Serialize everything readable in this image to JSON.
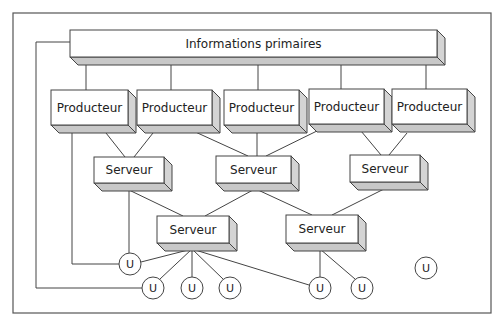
{
  "diagram": {
    "type": "network-topology",
    "frame": {
      "x1": 13,
      "y1": 13,
      "x2": 491,
      "y2": 313
    },
    "colors": {
      "line": "#444444",
      "face": "#ffffff",
      "side": "#d4d4d4",
      "bottom": "#c8c8c8",
      "frame": "#555555"
    },
    "info_box": {
      "label": "Informations primaires",
      "x": 70,
      "y": 30,
      "w": 367,
      "h": 27,
      "d": 8
    },
    "producteurs": [
      {
        "id": "P1",
        "label": "Producteur",
        "x": 51,
        "y": 90,
        "w": 77,
        "h": 35,
        "d": 8
      },
      {
        "id": "P2",
        "label": "Producteur",
        "x": 137,
        "y": 90,
        "w": 75,
        "h": 35,
        "d": 8
      },
      {
        "id": "P3",
        "label": "Producteur",
        "x": 224,
        "y": 90,
        "w": 75,
        "h": 35,
        "d": 8
      },
      {
        "id": "P4",
        "label": "Producteur",
        "x": 309,
        "y": 89,
        "w": 75,
        "h": 35,
        "d": 8
      },
      {
        "id": "P5",
        "label": "Producteur",
        "x": 392,
        "y": 89,
        "w": 75,
        "h": 35,
        "d": 8
      }
    ],
    "serveurs": [
      {
        "id": "S1",
        "label": "Serveur",
        "x": 94,
        "y": 157,
        "w": 70,
        "h": 26,
        "d": 8
      },
      {
        "id": "S2",
        "label": "Serveur",
        "x": 216,
        "y": 156,
        "w": 75,
        "h": 27,
        "d": 8
      },
      {
        "id": "S3",
        "label": "Serveur",
        "x": 350,
        "y": 155,
        "w": 70,
        "h": 27,
        "d": 8
      },
      {
        "id": "S4",
        "label": "Serveur",
        "x": 157,
        "y": 216,
        "w": 72,
        "h": 27,
        "d": 8
      },
      {
        "id": "S5",
        "label": "Serveur",
        "x": 286,
        "y": 215,
        "w": 72,
        "h": 28,
        "d": 8
      }
    ],
    "users": [
      {
        "id": "U1",
        "label": "U",
        "cx": 130,
        "cy": 264,
        "r": 11
      },
      {
        "id": "U2",
        "label": "U",
        "cx": 153,
        "cy": 288,
        "r": 11
      },
      {
        "id": "U3",
        "label": "U",
        "cx": 192,
        "cy": 288,
        "r": 11
      },
      {
        "id": "U4",
        "label": "U",
        "cx": 230,
        "cy": 288,
        "r": 11
      },
      {
        "id": "U5",
        "label": "U",
        "cx": 320,
        "cy": 288,
        "r": 11
      },
      {
        "id": "U6",
        "label": "U",
        "cx": 362,
        "cy": 288,
        "r": 11
      },
      {
        "id": "U7",
        "label": "U",
        "cx": 426,
        "cy": 268,
        "r": 11
      }
    ],
    "edges": [
      {
        "from": "Info",
        "to": "P1",
        "points": [
          [
            86,
            64
          ],
          [
            86,
            90
          ]
        ]
      },
      {
        "from": "Info",
        "to": "P2",
        "points": [
          [
            171,
            64
          ],
          [
            171,
            90
          ]
        ]
      },
      {
        "from": "Info",
        "to": "P3",
        "points": [
          [
            258,
            64
          ],
          [
            258,
            90
          ]
        ]
      },
      {
        "from": "Info",
        "to": "P4",
        "points": [
          [
            341,
            64
          ],
          [
            341,
            89
          ]
        ]
      },
      {
        "from": "Info",
        "to": "P5",
        "points": [
          [
            426,
            64
          ],
          [
            426,
            89
          ]
        ]
      },
      {
        "from": "P1",
        "to": "S1",
        "points": [
          [
            106,
            133
          ],
          [
            125,
            157
          ]
        ]
      },
      {
        "from": "P2",
        "to": "S1",
        "points": [
          [
            153,
            133
          ],
          [
            134,
            157
          ]
        ]
      },
      {
        "from": "P2",
        "to": "S2",
        "points": [
          [
            191,
            130
          ],
          [
            248,
            156
          ]
        ]
      },
      {
        "from": "P3",
        "to": "S2",
        "points": [
          [
            257,
            133
          ],
          [
            257,
            156
          ]
        ]
      },
      {
        "from": "P4",
        "to": "S2",
        "points": [
          [
            323,
            128
          ],
          [
            266,
            156
          ]
        ]
      },
      {
        "from": "P4",
        "to": "S3",
        "points": [
          [
            361,
            131
          ],
          [
            381,
            155
          ]
        ]
      },
      {
        "from": "P5",
        "to": "S3",
        "points": [
          [
            407,
            133
          ],
          [
            389,
            155
          ]
        ]
      },
      {
        "from": "S1",
        "to": "S4",
        "points": [
          [
            129,
            190
          ],
          [
            183,
            216
          ]
        ]
      },
      {
        "from": "S2",
        "to": "S4",
        "points": [
          [
            253,
            190
          ],
          [
            205,
            216
          ]
        ]
      },
      {
        "from": "S2",
        "to": "S5",
        "points": [
          [
            258,
            190
          ],
          [
            312,
            215
          ]
        ]
      },
      {
        "from": "S3",
        "to": "S5",
        "points": [
          [
            384,
            189
          ],
          [
            332,
            215
          ]
        ]
      },
      {
        "from": "S1",
        "to": "U1",
        "points": [
          [
            129,
            190
          ],
          [
            129,
            253
          ]
        ]
      },
      {
        "from": "S4",
        "to": "U1",
        "points": [
          [
            192,
            249
          ],
          [
            141,
            262
          ]
        ]
      },
      {
        "from": "S4",
        "to": "U2",
        "points": [
          [
            192,
            249
          ],
          [
            160,
            279
          ]
        ]
      },
      {
        "from": "S4",
        "to": "U3",
        "points": [
          [
            192,
            249
          ],
          [
            192,
            277
          ]
        ]
      },
      {
        "from": "S4",
        "to": "U4",
        "points": [
          [
            192,
            249
          ],
          [
            223,
            279
          ]
        ]
      },
      {
        "from": "S4",
        "to": "U5",
        "points": [
          [
            192,
            249
          ],
          [
            309,
            285
          ]
        ]
      },
      {
        "from": "S5",
        "to": "U5",
        "points": [
          [
            320,
            249
          ],
          [
            320,
            277
          ]
        ]
      },
      {
        "from": "S5",
        "to": "U6",
        "points": [
          [
            320,
            249
          ],
          [
            355,
            279
          ]
        ]
      },
      {
        "from": "P1",
        "to": "U1",
        "points": [
          [
            72,
            133
          ],
          [
            72,
            264
          ],
          [
            119,
            264
          ]
        ]
      },
      {
        "from": "Info",
        "to": "U2",
        "points": [
          [
            70,
            42
          ],
          [
            36,
            42
          ],
          [
            36,
            288
          ],
          [
            142,
            288
          ]
        ]
      }
    ]
  }
}
